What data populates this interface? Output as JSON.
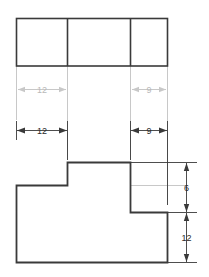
{
  "drawing": {
    "type": "orthographic-engineering-drawing",
    "background_color": "#ffffff",
    "line_color": "#3a3a3a",
    "faded_line_color": "#c8c8c8",
    "text_color": "#2b2b2b",
    "faded_text_color": "#b9b9b9",
    "views": {
      "top_view": {
        "name": "top-view",
        "shape": "rectangle-divided-in-three",
        "segments": 3
      },
      "front_view": {
        "name": "front-view",
        "shape": "stepped-profile"
      }
    },
    "dimensions": {
      "faded_row": [
        {
          "label": "12",
          "name": "faded-width-12"
        },
        {
          "label": "9",
          "name": "faded-width-9"
        }
      ],
      "horizontal_row": [
        {
          "label": "12",
          "name": "width-12"
        },
        {
          "label": "9",
          "name": "width-9"
        }
      ],
      "vertical": [
        {
          "label": "6",
          "name": "height-6"
        },
        {
          "label": "12",
          "name": "height-12"
        }
      ]
    }
  }
}
